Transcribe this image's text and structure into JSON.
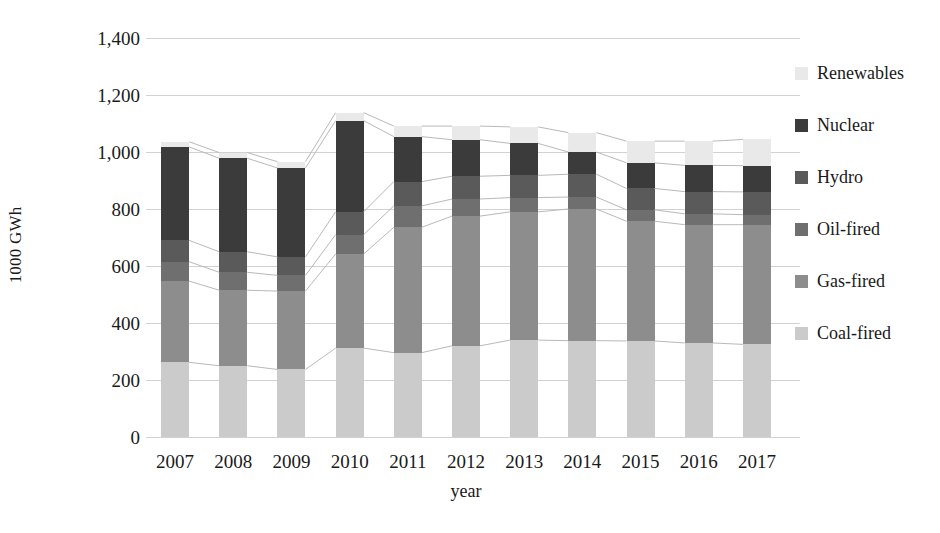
{
  "chart_data": {
    "type": "bar",
    "subtype": "stacked-column-with-connector-lines",
    "title": "",
    "xlabel": "year",
    "ylabel": "1000 GWh",
    "categories": [
      "2007",
      "2008",
      "2009",
      "2010",
      "2011",
      "2012",
      "2013",
      "2014",
      "2015",
      "2016",
      "2017"
    ],
    "ylim": [
      0,
      1400
    ],
    "ytick_labels": [
      "0",
      "200",
      "400",
      "600",
      "800",
      "1,000",
      "1,200",
      "1,400"
    ],
    "ytick_values": [
      0,
      200,
      400,
      600,
      800,
      1000,
      1200,
      1400
    ],
    "grid": true,
    "grid_axis": "y",
    "legend_position": "right",
    "stack_order_bottom_to_top": [
      "Coal-fired",
      "Gas-fired",
      "Oil-fired",
      "Hydro",
      "Nuclear",
      "Renewables"
    ],
    "series": [
      {
        "name": "Coal-fired",
        "color": "#cbcbcb",
        "values": [
          262,
          250,
          237,
          312,
          296,
          320,
          340,
          338,
          337,
          330,
          325
        ]
      },
      {
        "name": "Gas-fired",
        "color": "#8d8d8d",
        "values": [
          285,
          265,
          275,
          330,
          440,
          455,
          450,
          462,
          420,
          415,
          420
        ]
      },
      {
        "name": "Oil-fired",
        "color": "#6f6f6f",
        "values": [
          68,
          63,
          55,
          68,
          75,
          60,
          50,
          42,
          40,
          38,
          35
        ]
      },
      {
        "name": "Hydro",
        "color": "#5a5a5a",
        "values": [
          75,
          72,
          65,
          80,
          85,
          80,
          78,
          80,
          75,
          78,
          80
        ]
      },
      {
        "name": "Nuclear",
        "color": "#3b3b3b",
        "values": [
          328,
          328,
          312,
          320,
          158,
          128,
          112,
          78,
          90,
          92,
          92
        ]
      },
      {
        "name": "Renewables",
        "color": "#e9e9e9",
        "values": [
          18,
          20,
          22,
          28,
          37,
          48,
          58,
          68,
          76,
          85,
          92
        ]
      }
    ],
    "totals": [
      1036,
      998,
      966,
      1138,
      1091,
      1091,
      1088,
      1068,
      1038,
      1038,
      1044
    ]
  },
  "legend": {
    "items": [
      {
        "label": "Renewables",
        "color": "#e9e9e9"
      },
      {
        "label": "Nuclear",
        "color": "#3b3b3b"
      },
      {
        "label": "Hydro",
        "color": "#5a5a5a"
      },
      {
        "label": "Oil-fired",
        "color": "#6f6f6f"
      },
      {
        "label": "Gas-fired",
        "color": "#8d8d8d"
      },
      {
        "label": "Coal-fired",
        "color": "#cbcbcb"
      }
    ]
  },
  "axes": {
    "y_title": "1000 GWh",
    "x_title": "year"
  },
  "style": {
    "gridline_color": "#d2d2d2",
    "connector_color": "#b9b9b9",
    "background": "#ffffff",
    "text_color": "#1a1a1a"
  }
}
